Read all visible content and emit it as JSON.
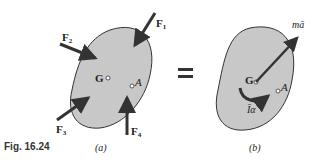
{
  "figure": {
    "caption": "Fig. 16.24",
    "panel_a": {
      "label": "(a)",
      "points": {
        "G": "G",
        "A": "A"
      },
      "forces": [
        {
          "name": "F",
          "sub": "1"
        },
        {
          "name": "F",
          "sub": "2"
        },
        {
          "name": "F",
          "sub": "3"
        },
        {
          "name": "F",
          "sub": "4"
        }
      ]
    },
    "equals": "=",
    "panel_b": {
      "label": "(b)",
      "points": {
        "G": "G",
        "A": "A"
      },
      "vector_label": "mā",
      "couple_label": "Īα"
    },
    "colors": {
      "body_fill": "#c8c8c8",
      "outline": "#333333",
      "arrow": "#333333"
    }
  }
}
